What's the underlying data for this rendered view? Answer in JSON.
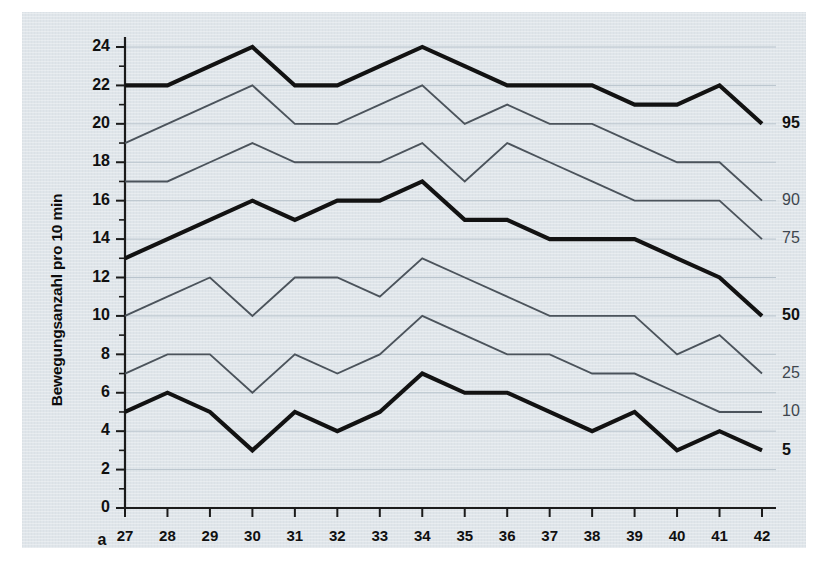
{
  "figure": {
    "panel_letter": "a",
    "background_color": "#dfe5ea",
    "bold_series_color": "#121212",
    "thin_series_color": "#4b535b",
    "gridline_color": "#b9c4cd"
  },
  "chart_data": {
    "type": "line",
    "title": "",
    "subtitle": "",
    "xlabel": "",
    "ylabel": "Bewegungsanzahl pro 10 min",
    "x": [
      27,
      28,
      29,
      30,
      31,
      32,
      33,
      34,
      35,
      36,
      37,
      38,
      39,
      40,
      41,
      42
    ],
    "categories": [
      "27",
      "28",
      "29",
      "30",
      "31",
      "32",
      "33",
      "34",
      "35",
      "36",
      "37",
      "38",
      "39",
      "40",
      "41",
      "42"
    ],
    "xlim": [
      27,
      42
    ],
    "ylim": [
      0,
      24
    ],
    "yticks": [
      0,
      2,
      4,
      6,
      8,
      10,
      12,
      14,
      16,
      18,
      20,
      22,
      24
    ],
    "ytick_labels": [
      "0",
      "2",
      "4",
      "6",
      "8",
      "10",
      "12",
      "14",
      "16",
      "18",
      "20",
      "22",
      "24"
    ],
    "xticks": [
      27,
      28,
      29,
      30,
      31,
      32,
      33,
      34,
      35,
      36,
      37,
      38,
      39,
      40,
      41,
      42
    ],
    "xtick_labels": [
      "27",
      "28",
      "29",
      "30",
      "31",
      "32",
      "33",
      "34",
      "35",
      "36",
      "37",
      "38",
      "39",
      "40",
      "41",
      "42"
    ],
    "grid": true,
    "grid_axis": "y",
    "legend": "right-inline",
    "series": [
      {
        "name": "95",
        "label": "95",
        "emphasis": "bold",
        "values": [
          22,
          22,
          23,
          24,
          22,
          22,
          23,
          24,
          23,
          22,
          22,
          22,
          21,
          21,
          22,
          20
        ]
      },
      {
        "name": "90",
        "label": "90",
        "emphasis": "thin",
        "values": [
          19,
          20,
          21,
          22,
          20,
          20,
          21,
          22,
          20,
          21,
          20,
          20,
          19,
          18,
          18,
          16
        ]
      },
      {
        "name": "75",
        "label": "75",
        "emphasis": "thin",
        "values": [
          17,
          17,
          18,
          19,
          18,
          18,
          18,
          19,
          17,
          19,
          18,
          17,
          16,
          16,
          16,
          14
        ]
      },
      {
        "name": "50",
        "label": "50",
        "emphasis": "bold",
        "values": [
          13,
          14,
          15,
          16,
          15,
          16,
          16,
          17,
          15,
          15,
          14,
          14,
          14,
          13,
          12,
          10
        ]
      },
      {
        "name": "25",
        "label": "25",
        "emphasis": "thin",
        "values": [
          10,
          11,
          12,
          10,
          12,
          12,
          11,
          13,
          12,
          11,
          10,
          10,
          10,
          8,
          9,
          7
        ]
      },
      {
        "name": "10",
        "label": "10",
        "emphasis": "thin",
        "values": [
          7,
          8,
          8,
          6,
          8,
          7,
          8,
          10,
          9,
          8,
          8,
          7,
          7,
          6,
          5,
          5
        ]
      },
      {
        "name": "5",
        "label": "5",
        "emphasis": "bold",
        "values": [
          5,
          6,
          5,
          3,
          5,
          4,
          5,
          7,
          6,
          6,
          5,
          4,
          5,
          3,
          4,
          3
        ]
      }
    ]
  }
}
